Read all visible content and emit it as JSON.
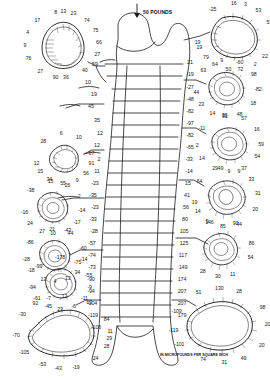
{
  "figure": {
    "load_label": "50 POUNDS",
    "unit_label": "IN MICROPOUNDS PER SQUARE INCH",
    "ink_color": "#1a1a1a",
    "background": "#ffffff"
  },
  "chart_data": {
    "type": "diagram",
    "units": "micropounds per square inch",
    "xlabel": "",
    "ylabel": "",
    "shaft_levels": [
      {
        "level": 1,
        "left": 59,
        "right": 21
      },
      {
        "level": 2,
        "left": 10,
        "right": -19
      },
      {
        "level": 3,
        "left": 19,
        "right": -27
      },
      {
        "level": 4,
        "left": 45,
        "right": -48
      },
      {
        "level": 5,
        "left": 35,
        "right": -82
      },
      {
        "level": 6,
        "left": 12,
        "right": -97
      },
      {
        "level": 7,
        "left": 12,
        "right": -82
      },
      {
        "level": 8,
        "left": 2,
        "right": -65
      },
      {
        "level": 9,
        "left": 11,
        "right": -33
      },
      {
        "level": 10,
        "left": -23,
        "right": -14
      },
      {
        "level": 11,
        "left": -35,
        "right": 15
      },
      {
        "level": 12,
        "left": -23,
        "right": 41
      },
      {
        "level": 13,
        "left": -33,
        "right": 56
      },
      {
        "level": 14,
        "left": -28,
        "right": 80
      },
      {
        "level": 15,
        "left": -57,
        "right": 105
      },
      {
        "level": 16,
        "left": -74,
        "right": 125
      },
      {
        "level": 17,
        "left": -73,
        "right": 117
      },
      {
        "level": 18,
        "left": -90,
        "right": 149
      },
      {
        "level": 19,
        "left": -94,
        "right": 174
      },
      {
        "level": 20,
        "left": -104,
        "right": 207
      },
      {
        "level": 21,
        "left": -119,
        "right": 207
      },
      {
        "level": 22,
        "left": -106,
        "right": 179
      }
    ],
    "sections": [
      {
        "id": "left-1",
        "position": "upper-left",
        "callouts": [
          {
            "value": 8,
            "angle": -100
          },
          {
            "value": 13,
            "angle": -88
          },
          {
            "value": 23,
            "angle": -72
          },
          {
            "value": 17,
            "angle": -132
          },
          {
            "value": 74,
            "angle": -48
          },
          {
            "value": 4,
            "angle": -158
          },
          {
            "value": 75,
            "angle": -25
          },
          {
            "value": 9,
            "angle": 178
          },
          {
            "value": 66,
            "angle": -4
          },
          {
            "value": 76,
            "angle": 155
          },
          {
            "value": 27,
            "angle": 18
          },
          {
            "value": 27,
            "angle": 126
          },
          {
            "value": 90,
            "angle": 100
          },
          {
            "value": 36,
            "angle": 84
          },
          {
            "value": 40,
            "angle": 52
          }
        ]
      },
      {
        "id": "left-2",
        "position": "left-upper-mid",
        "callouts": [
          {
            "value": 6,
            "angle": -96
          },
          {
            "value": 10,
            "angle": -58
          },
          {
            "value": 28,
            "angle": -138
          },
          {
            "value": 67,
            "angle": -12
          },
          {
            "value": 12,
            "angle": 168
          },
          {
            "value": 91,
            "angle": 12
          },
          {
            "value": 15,
            "angle": 148
          },
          {
            "value": 56,
            "angle": 38
          },
          {
            "value": 34,
            "angle": 122
          },
          {
            "value": 55,
            "angle": 92
          },
          {
            "value": 9,
            "angle": 62
          }
        ]
      },
      {
        "id": "left-3",
        "position": "left-mid",
        "callouts": [
          {
            "value": 15,
            "angle": -95
          },
          {
            "value": 26,
            "angle": -60
          },
          {
            "value": -38,
            "angle": -140
          },
          {
            "value": 2,
            "angle": -26
          },
          {
            "value": -16,
            "angle": 170
          },
          {
            "value": -14,
            "angle": 6
          },
          {
            "value": 24,
            "angle": 142
          },
          {
            "value": -17,
            "angle": 34
          },
          {
            "value": 27,
            "angle": 112
          },
          {
            "value": 10,
            "angle": 90
          },
          {
            "value": -43,
            "angle": 60
          }
        ]
      },
      {
        "id": "left-4",
        "position": "left-lower-mid",
        "callouts": [
          {
            "value": 21,
            "angle": -96
          },
          {
            "value": 44,
            "angle": -58
          },
          {
            "value": -86,
            "angle": -150
          },
          {
            "value": -60,
            "angle": -16
          },
          {
            "value": -28,
            "angle": 172
          },
          {
            "value": -14,
            "angle": 8
          },
          {
            "value": -18,
            "angle": 146
          },
          {
            "value": 34,
            "angle": 40
          },
          {
            "value": 13,
            "angle": 114
          },
          {
            "value": 4,
            "angle": 90
          },
          {
            "value": 13,
            "angle": 64
          }
        ]
      },
      {
        "id": "left-5",
        "position": "left-lower",
        "callouts": [
          {
            "value": -178,
            "angle": -92
          },
          {
            "value": -75,
            "angle": -55
          },
          {
            "value": -99,
            "angle": -140
          },
          {
            "value": -55,
            "angle": -18
          },
          {
            "value": -94,
            "angle": 172
          },
          {
            "value": -9,
            "angle": 8
          },
          {
            "value": -61,
            "angle": 146
          },
          {
            "value": -11,
            "angle": 36
          },
          {
            "value": -45,
            "angle": 116
          },
          {
            "value": 23,
            "angle": 92
          },
          {
            "value": -6,
            "angle": 64
          }
        ]
      },
      {
        "id": "left-6",
        "position": "bottom-left",
        "callouts": [
          {
            "value": 12,
            "angle": -88
          },
          {
            "value": 63,
            "angle": -56
          },
          {
            "value": -7,
            "angle": -108
          },
          {
            "value": 92,
            "angle": -126
          },
          {
            "value": -30,
            "angle": -150
          },
          {
            "value": 84,
            "angle": -22
          },
          {
            "value": 11,
            "angle": -2
          },
          {
            "value": 29,
            "angle": 10
          },
          {
            "value": 28,
            "angle": 22
          },
          {
            "value": -70,
            "angle": 176
          },
          {
            "value": 24,
            "angle": 46
          },
          {
            "value": -105,
            "angle": 146
          },
          {
            "value": -53,
            "angle": 116
          },
          {
            "value": -43,
            "angle": 96
          },
          {
            "value": -19,
            "angle": 74
          }
        ]
      },
      {
        "id": "right-1",
        "position": "top-right",
        "callouts": [
          {
            "value": 16,
            "angle": -92
          },
          {
            "value": 3,
            "angle": -74
          },
          {
            "value": 53,
            "angle": -52
          },
          {
            "value": -25,
            "angle": -126
          },
          {
            "value": 53,
            "angle": -26
          },
          {
            "value": 19,
            "angle": 170
          },
          {
            "value": 31,
            "angle": -4
          },
          {
            "value": 19,
            "angle": 160
          },
          {
            "value": 8,
            "angle": 16
          },
          {
            "value": 79,
            "angle": 140
          },
          {
            "value": 22,
            "angle": 38
          },
          {
            "value": 64,
            "angle": 122
          },
          {
            "value": 50,
            "angle": 100
          },
          {
            "value": 72,
            "angle": 82
          },
          {
            "value": 2,
            "angle": 58
          }
        ]
      },
      {
        "id": "right-2",
        "position": "right-upper",
        "callouts": [
          {
            "value": 9,
            "angle": -100
          },
          {
            "value": -60,
            "angle": -66
          },
          {
            "value": 63,
            "angle": -140
          },
          {
            "value": 98,
            "angle": -30
          },
          {
            "value": 44,
            "angle": 172
          },
          {
            "value": -82,
            "angle": 2
          },
          {
            "value": 23,
            "angle": 146
          },
          {
            "value": 18,
            "angle": 32
          },
          {
            "value": 14,
            "angle": 118
          },
          {
            "value": 91,
            "angle": 94
          },
          {
            "value": 48,
            "angle": 66
          }
        ]
      },
      {
        "id": "right-3",
        "position": "right-mid-upper",
        "callouts": [
          {
            "value": 39,
            "angle": -98
          },
          {
            "value": 57,
            "angle": -62
          },
          {
            "value": -11,
            "angle": -148
          },
          {
            "value": 16,
            "angle": -30
          },
          {
            "value": 2,
            "angle": 176
          },
          {
            "value": 59,
            "angle": 2
          },
          {
            "value": 14,
            "angle": 148
          },
          {
            "value": 54,
            "angle": 28
          },
          {
            "value": 29,
            "angle": 116
          },
          {
            "value": 9,
            "angle": 90
          },
          {
            "value": 37,
            "angle": 62
          }
        ]
      },
      {
        "id": "right-4",
        "position": "right-mid",
        "callouts": [
          {
            "value": 49,
            "angle": -100
          },
          {
            "value": 9,
            "angle": -66
          },
          {
            "value": 33,
            "angle": -38
          },
          {
            "value": 64,
            "angle": -146
          },
          {
            "value": 31,
            "angle": -8
          },
          {
            "value": 19,
            "angle": 170
          },
          {
            "value": 14,
            "angle": 152
          },
          {
            "value": 20,
            "angle": 24
          },
          {
            "value": 9,
            "angle": 126
          },
          {
            "value": 85,
            "angle": 96
          },
          {
            "value": 44,
            "angle": 66
          }
        ]
      },
      {
        "id": "right-5",
        "position": "right-lower-mid",
        "callouts": [
          {
            "value": 146,
            "angle": -112
          },
          {
            "value": 90,
            "angle": -62
          },
          {
            "value": 86,
            "angle": -10
          },
          {
            "value": 54,
            "angle": 18
          },
          {
            "value": 30,
            "angle": 96
          },
          {
            "value": 28,
            "angle": 126
          },
          {
            "value": 11,
            "angle": 68
          }
        ]
      },
      {
        "id": "right-6",
        "position": "bottom-right",
        "callouts": [
          {
            "value": 130,
            "angle": -92
          },
          {
            "value": 28,
            "angle": -68
          },
          {
            "value": 51,
            "angle": -118
          },
          {
            "value": 98,
            "angle": -30
          },
          {
            "value": -109,
            "angle": -158
          },
          {
            "value": 207,
            "angle": -2
          },
          {
            "value": -119,
            "angle": 172
          },
          {
            "value": 20,
            "angle": 32
          },
          {
            "value": -101,
            "angle": 150
          },
          {
            "value": 49,
            "angle": 62
          },
          {
            "value": 31,
            "angle": 86
          },
          {
            "value": 74,
            "angle": 112
          }
        ]
      }
    ]
  }
}
